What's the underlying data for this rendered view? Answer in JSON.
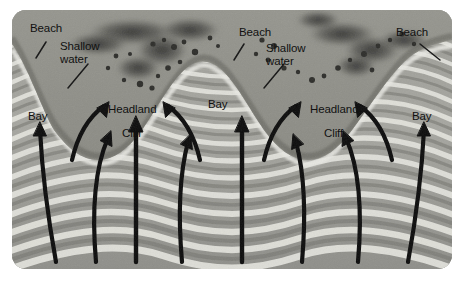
{
  "figure": {
    "type": "coastal-geomorphology-diagram",
    "background_color": "#ffffff",
    "photo_tone": "grayscale"
  },
  "labels": {
    "beach_left": "Beach",
    "shallow_water_left_line1": "Shallow",
    "shallow_water_left_line2": "water",
    "bay_left": "Bay",
    "headland_left": "Headland",
    "cliff_left": "Cliff",
    "beach_center": "Beach",
    "shallow_water_center_line1": "Shallow",
    "shallow_water_center_line2": "water",
    "bay_center": "Bay",
    "headland_right": "Headland",
    "cliff_right": "Cliff",
    "beach_right": "Beach",
    "bay_right": "Bay"
  },
  "colors": {
    "label_text": "#111111",
    "leader_line": "#151515",
    "arrow": "#0d0d0d",
    "water_light": "#d8d8d3",
    "water_mid": "#9f9f99",
    "water_dark": "#6f6f6a",
    "land_base": "#8d8d86",
    "vegetation_dark": "#3a3a36",
    "frame_border": "#8a8a84"
  },
  "annotations": {
    "arrow_count_total": 10,
    "wave_crest_count": 13,
    "headland_count": 2,
    "bay_count": 3,
    "beach_count": 3,
    "description": "Curved wave-orthogonal arrows refract so that wave energy converges on the two headlands and diverges within the bays."
  }
}
